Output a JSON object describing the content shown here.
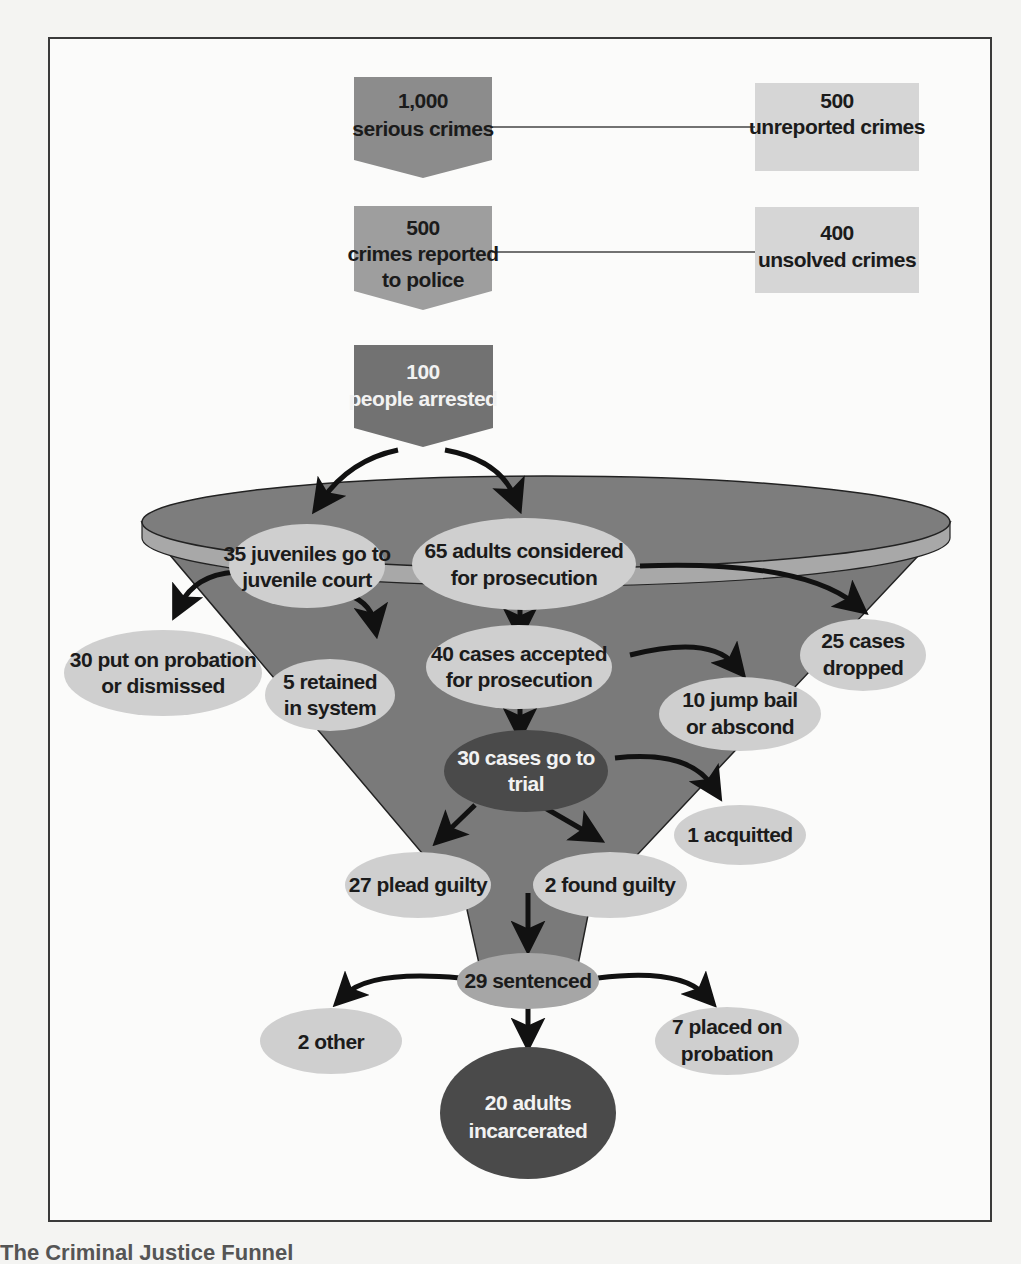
{
  "figure": {
    "caption": "The Criminal Justice Funnel",
    "colors": {
      "box_dark": "#8c8c8c",
      "box_mid": "#9e9e9e",
      "box_light": "#d6d6d6",
      "box_arrested": "#727272",
      "funnel_body": "#7a7a7a",
      "funnel_rim": "#a8a8a8",
      "ellipse_light": "#cfcfcf",
      "ellipse_dark": "#4a4a4a",
      "arrow": "#111111"
    }
  },
  "top_boxes": [
    {
      "number": "1,000",
      "label": "serious crimes"
    },
    {
      "number": "500",
      "label_line1": "crimes reported",
      "label_line2": "to police"
    },
    {
      "number": "100",
      "label": "people arrested"
    }
  ],
  "side_boxes": [
    {
      "number": "500",
      "label": "unreported crimes"
    },
    {
      "number": "400",
      "label": "unsolved crimes"
    }
  ],
  "nodes": {
    "juveniles": [
      "35 juveniles go to",
      "juvenile court"
    ],
    "adults": [
      "65 adults considered",
      "for prosecution"
    ],
    "probation_dismissed": [
      "30 put on probation",
      "or dismissed"
    ],
    "retained": [
      "5 retained",
      "in system"
    ],
    "accepted": [
      "40 cases accepted",
      "for prosecution"
    ],
    "dropped": [
      "25 cases",
      "dropped"
    ],
    "jump_bail": [
      "10 jump bail",
      "or abscond"
    ],
    "trial": [
      "30 cases go to",
      "trial"
    ],
    "acquitted": [
      "1 acquitted"
    ],
    "plead_guilty": [
      "27 plead guilty"
    ],
    "found_guilty": [
      "2 found guilty"
    ],
    "sentenced": [
      "29 sentenced"
    ],
    "other": [
      "2 other"
    ],
    "placed_probation": [
      "7 placed on",
      "probation"
    ],
    "incarcerated": [
      "20 adults",
      "incarcerated"
    ]
  }
}
